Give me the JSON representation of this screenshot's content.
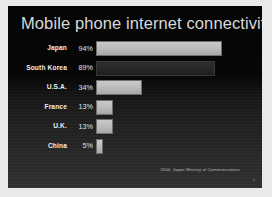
{
  "slide": {
    "title": "Mobile phone internet connectivity rate",
    "source_note": "2004, Japan Ministry of Communications",
    "page_marker": "7",
    "colors": {
      "background_top": "#050505",
      "background_bottom": "#303030",
      "title_text": "#d8d8d8",
      "bar_fill": "#bdbdbd",
      "bar_fill_shadowed": "#272727",
      "frame": "#e9e9e9"
    }
  },
  "chart_data": {
    "type": "bar",
    "title": "Mobile phone internet connectivity rate",
    "xlabel": "",
    "ylabel": "",
    "orientation": "horizontal",
    "grid": false,
    "legend": false,
    "xlim": [
      0,
      100
    ],
    "categories": [
      "Japan",
      "South Korea",
      "U.S.A.",
      "France",
      "U.K.",
      "China"
    ],
    "values": [
      94,
      89,
      34,
      13,
      13,
      5
    ],
    "value_labels": [
      "94%",
      "89%",
      "34%",
      "13%",
      "13%",
      "5%"
    ],
    "annotations": [
      "2004, Japan Ministry of Communications"
    ],
    "bars": [
      {
        "category": "Japan",
        "value": 94,
        "label": "94%",
        "shadowed": false
      },
      {
        "category": "South Korea",
        "value": 89,
        "label": "89%",
        "shadowed": true
      },
      {
        "category": "U.S.A.",
        "value": 34,
        "label": "34%",
        "shadowed": false
      },
      {
        "category": "France",
        "value": 13,
        "label": "13%",
        "shadowed": false
      },
      {
        "category": "U.K.",
        "value": 13,
        "label": "13%",
        "shadowed": false
      },
      {
        "category": "China",
        "value": 5,
        "label": "5%",
        "shadowed": false
      }
    ]
  }
}
